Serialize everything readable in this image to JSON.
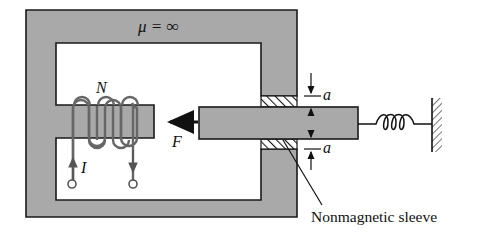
{
  "diagram": {
    "type": "magnetic actuator with plunger",
    "labels": {
      "permeability": "μ = ∞",
      "turns": "N",
      "current": "I",
      "force": "F",
      "gap_top": "a",
      "gap_bottom": "a",
      "sleeve": "Nonmagnetic sleeve"
    },
    "colors": {
      "core_fill": "#a9a9a9",
      "outline": "#1a1a1a",
      "background": "#ffffff"
    },
    "components": [
      "magnetic-core",
      "coil",
      "plunger",
      "nonmagnetic-sleeve",
      "spring",
      "fixed-wall"
    ]
  }
}
